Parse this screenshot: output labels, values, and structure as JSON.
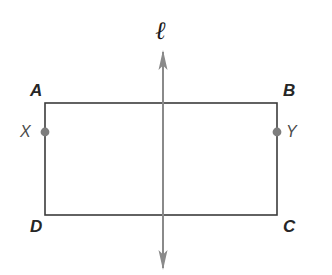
{
  "figure": {
    "kind": "geometry-diagram",
    "background_color": "#ffffff"
  },
  "labels": {
    "vertex_top_left": "A",
    "vertex_top_right": "B",
    "vertex_bottom_right": "C",
    "vertex_bottom_left": "D",
    "point_left": "X",
    "point_right": "Y",
    "line": "ℓ"
  },
  "colors": {
    "rectangle_stroke": "#3b3b3b",
    "symmetry_line_stroke": "#8a8a8a",
    "arrowhead_fill": "#8a8a8a",
    "point_fill": "#7d7d7d",
    "vertex_label_color": "#262626",
    "point_label_color": "#4a4a4a",
    "line_label_color": "#1a1a1a"
  },
  "geometry": {
    "rectangle": {
      "left": 45,
      "top": 103,
      "right": 277,
      "bottom": 215,
      "width": 232,
      "height": 112,
      "stroke_width": 1.6
    },
    "symmetry_line": {
      "x": 163,
      "top_end": 52,
      "bottom_end": 268,
      "stroke_width": 2,
      "arrowheads": [
        "up",
        "down"
      ],
      "arrow_half_width": 4.5,
      "arrow_length": 20
    },
    "points": [
      {
        "name": "X",
        "cx": 45,
        "cy": 132,
        "r": 4.4
      },
      {
        "name": "Y",
        "cx": 277,
        "cy": 132,
        "r": 4.4
      }
    ]
  }
}
